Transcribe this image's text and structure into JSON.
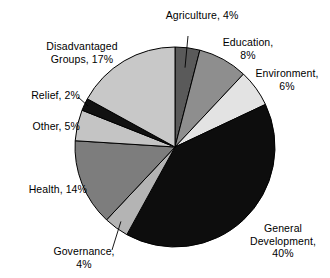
{
  "chart_data": {
    "type": "pie",
    "title": "",
    "subtitle": "",
    "xlabel": "",
    "ylabel": "",
    "legend_position": "none",
    "grid": false,
    "labels_inline": true,
    "units": "percent",
    "categories": [
      "Agriculture",
      "Education",
      "Environment",
      "General Development",
      "Governance",
      "Health",
      "Other",
      "Relief",
      "Disadvantaged Groups"
    ],
    "values": [
      4,
      8,
      6,
      40,
      4,
      14,
      5,
      2,
      17
    ],
    "slices": [
      {
        "name": "Agriculture",
        "value": 4,
        "label": "Agriculture, 4%",
        "label_lines": [
          "Agriculture, 4%"
        ],
        "color": "#5a5a5a",
        "start_angle": 0,
        "end_angle": 14.4,
        "leader_line": true
      },
      {
        "name": "Education",
        "value": 8,
        "label": "Education, 8%",
        "label_lines": [
          "Education,",
          "8%"
        ],
        "color": "#8e8e8e",
        "start_angle": 14.4,
        "end_angle": 43.2,
        "leader_line": false
      },
      {
        "name": "Environment",
        "value": 6,
        "label": "Environment, 6%",
        "label_lines": [
          "Environment,",
          "6%"
        ],
        "color": "#e3e3e3",
        "start_angle": 43.2,
        "end_angle": 64.8,
        "leader_line": false
      },
      {
        "name": "General Development",
        "value": 40,
        "label": "General Development, 40%",
        "label_lines": [
          "General",
          "Development,",
          "40%"
        ],
        "color": "#0d0d0d",
        "start_angle": 64.8,
        "end_angle": 208.8,
        "leader_line": false
      },
      {
        "name": "Governance",
        "value": 4,
        "label": "Governance, 4%",
        "label_lines": [
          "Governance,",
          "4%"
        ],
        "color": "#b4b4b4",
        "start_angle": 208.8,
        "end_angle": 223.2,
        "leader_line": true
      },
      {
        "name": "Health",
        "value": 14,
        "label": "Health, 14%",
        "label_lines": [
          "Health, 14%"
        ],
        "color": "#7d7d7d",
        "start_angle": 223.2,
        "end_angle": 273.6,
        "leader_line": false
      },
      {
        "name": "Other",
        "value": 5,
        "label": "Other, 5%",
        "label_lines": [
          "Other, 5%"
        ],
        "color": "#c4c4c4",
        "start_angle": 273.6,
        "end_angle": 291.6,
        "leader_line": false
      },
      {
        "name": "Relief",
        "value": 2,
        "label": "Relief, 2%",
        "label_lines": [
          "Relief, 2%"
        ],
        "color": "#111111",
        "start_angle": 291.6,
        "end_angle": 298.8,
        "leader_line": true
      },
      {
        "name": "Disadvantaged Groups",
        "value": 17,
        "label": "Disadvantaged Groups, 17%",
        "label_lines": [
          "Disadvantaged",
          "Groups, 17%"
        ],
        "color": "#c8c8c8",
        "start_angle": 298.8,
        "end_angle": 360,
        "leader_line": false
      }
    ],
    "total": 100,
    "geometry": {
      "center_x": 175,
      "center_y": 147,
      "radius": 100,
      "start_at_top": true,
      "direction": "clockwise"
    },
    "colors": {
      "outline": "#000000",
      "background": "#ffffff",
      "text": "#000000"
    }
  }
}
